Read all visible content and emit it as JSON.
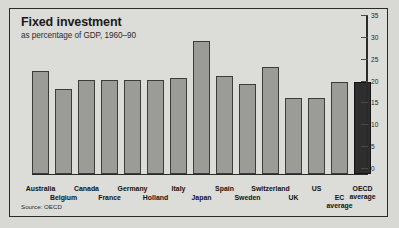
{
  "chart_data": {
    "type": "bar",
    "title": "Fixed investment",
    "subtitle": "as percentage of GDP, 1960–90",
    "source": "Source: OECD",
    "xlabel": "",
    "ylabel": "",
    "ylim": [
      0,
      35
    ],
    "yticks": [
      0,
      5,
      10,
      15,
      20,
      25,
      30,
      35
    ],
    "ytick_labels": [
      "0",
      "5",
      "10",
      "15",
      "20",
      "25",
      "30",
      "35"
    ],
    "axis_position": "right",
    "grid": false,
    "legend": false,
    "categories": [
      "Australia",
      "Belgium",
      "Canada",
      "France",
      "Germany",
      "Holland",
      "Italy",
      "Japan",
      "Spain",
      "Sweden",
      "Switzerland",
      "UK",
      "US",
      "EC average",
      "OECD average"
    ],
    "category_rows": [
      0,
      1,
      0,
      1,
      0,
      1,
      0,
      1,
      0,
      1,
      0,
      1,
      0,
      1,
      0
    ],
    "values": [
      23.5,
      19.5,
      21.5,
      21.5,
      21.5,
      21.5,
      22.0,
      30.5,
      22.5,
      20.5,
      24.5,
      17.5,
      17.5,
      21.0,
      21.0
    ],
    "highlight_index": 14,
    "colors": {
      "bar": "#9b9b97",
      "bar_highlight": "#2e2e2e",
      "bar_border": "#3c3c3c",
      "panel_background": "#dcdcd8",
      "page_background": "#d8d8d4",
      "axis": "#2a2a2a",
      "text": "#121212"
    }
  },
  "labels": {
    "multiline": {
      "EC average": [
        "EC",
        "average"
      ],
      "OECD average": [
        "OECD",
        "average"
      ]
    }
  }
}
